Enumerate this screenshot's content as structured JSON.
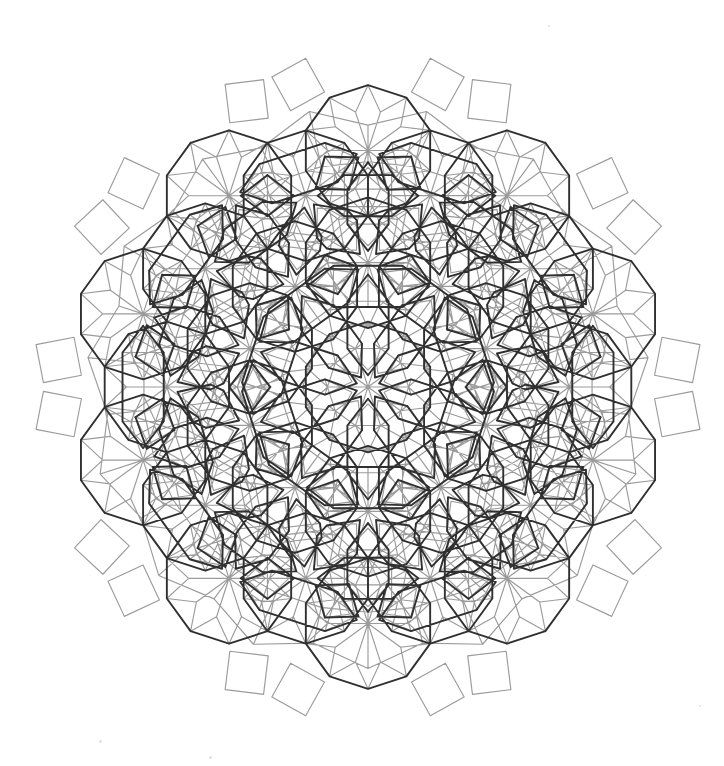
{
  "figure": {
    "width": 724,
    "height": 766,
    "background": "#ffffff"
  },
  "style": {
    "grid_color": "#9b9b9b",
    "girih_color": "#303030",
    "grid_width": 1.15,
    "girih_width": 1.9,
    "background": "#ffffff"
  },
  "geometry": {
    "center_x": 368,
    "center_y": 387,
    "unit": 43.0,
    "rotation_deg": 0,
    "symmetry_fold": 10,
    "ring_radii": [
      0,
      1,
      2,
      3,
      4
    ],
    "bounding_radius": 352,
    "outline_sides": 10
  },
  "chart_data": {
    "type": "diagram",
    "layers": [
      {
        "name": "underlying-grid",
        "color": "#9b9b9b",
        "stroke": 1.15,
        "tiles": [
          "square",
          "rhombus-72",
          "rhombus-36",
          "triangle",
          "hexagon"
        ],
        "count_estimate": 520
      },
      {
        "name": "girih-overlay",
        "color": "#303030",
        "stroke": 1.9,
        "tiles": [
          "decagon",
          "elongated-hexagon",
          "bow-tie",
          "pentagon"
        ],
        "count_estimate": 96
      }
    ],
    "motif_centers": [
      {
        "id": "center",
        "x": 368,
        "y": 387,
        "type": "decagon-star"
      },
      {
        "id": "n",
        "x": 368,
        "y": 215,
        "type": "hexagon-star"
      },
      {
        "id": "ne",
        "x": 531,
        "y": 268,
        "type": "hexagon-star"
      },
      {
        "id": "se",
        "x": 531,
        "y": 506,
        "type": "hexagon-star"
      },
      {
        "id": "s",
        "x": 368,
        "y": 559,
        "type": "hexagon-star"
      },
      {
        "id": "sw",
        "x": 205,
        "y": 506,
        "type": "hexagon-star"
      },
      {
        "id": "nw",
        "x": 205,
        "y": 268,
        "type": "hexagon-star"
      }
    ],
    "outer_points": [
      {
        "id": "left-star",
        "x": 40,
        "y": 387
      },
      {
        "id": "right-star",
        "x": 696,
        "y": 387
      }
    ]
  },
  "artifacts": [
    {
      "name": "speck",
      "x": 372,
      "y": 571,
      "size": 5
    },
    {
      "name": "speck",
      "x": 171,
      "y": 504,
      "size": 3
    },
    {
      "name": "speck",
      "x": 100,
      "y": 741,
      "size": 3
    },
    {
      "name": "speck",
      "x": 210,
      "y": 757,
      "size": 3
    },
    {
      "name": "speck",
      "x": 549,
      "y": 26,
      "size": 2
    },
    {
      "name": "speck",
      "x": 700,
      "y": 706,
      "size": 2
    }
  ]
}
